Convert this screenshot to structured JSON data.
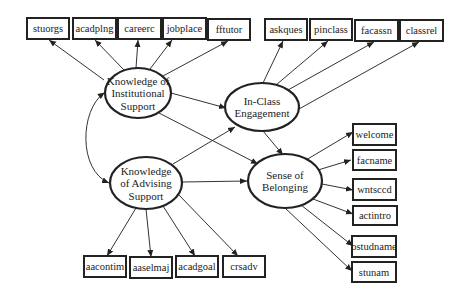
{
  "colors": {
    "stroke": "#222222",
    "background": "#ffffff"
  },
  "latents": [
    {
      "id": "kis",
      "lines": [
        "Knowledge of",
        "Institutional",
        "Support"
      ],
      "cx": 138,
      "cy": 93,
      "rx": 33,
      "ry": 25
    },
    {
      "id": "ice",
      "lines": [
        "In-Class",
        "Engagement"
      ],
      "cx": 262,
      "cy": 107,
      "rx": 37,
      "ry": 24
    },
    {
      "id": "kas",
      "lines": [
        "Knowledge",
        "of  Advising",
        "Support"
      ],
      "cx": 146,
      "cy": 183,
      "rx": 36,
      "ry": 26
    },
    {
      "id": "sob",
      "lines": [
        "Sense of",
        "Belonging"
      ],
      "cx": 285,
      "cy": 181,
      "rx": 37,
      "ry": 27
    }
  ],
  "indicators": [
    {
      "id": "stuorgs",
      "label": "stuorgs",
      "x": 27,
      "y": 18,
      "w": 42,
      "h": 21,
      "factor": "kis"
    },
    {
      "id": "acadplng",
      "label": "acadplng",
      "x": 73,
      "y": 18,
      "w": 43,
      "h": 21,
      "factor": "kis"
    },
    {
      "id": "careerc",
      "label": "careerc",
      "x": 118,
      "y": 18,
      "w": 43,
      "h": 21,
      "factor": "kis"
    },
    {
      "id": "jobplace",
      "label": "jobplace",
      "x": 163,
      "y": 18,
      "w": 43,
      "h": 21,
      "factor": "kis"
    },
    {
      "id": "fftutor",
      "label": "fftutor",
      "x": 208,
      "y": 19,
      "w": 42,
      "h": 21,
      "factor": "kis"
    },
    {
      "id": "askques",
      "label": "askques",
      "x": 265,
      "y": 19,
      "w": 42,
      "h": 21,
      "factor": "ice"
    },
    {
      "id": "pinclass",
      "label": "pinclass",
      "x": 310,
      "y": 19,
      "w": 42,
      "h": 21,
      "factor": "ice"
    },
    {
      "id": "facassn",
      "label": "facassn",
      "x": 355,
      "y": 20,
      "w": 43,
      "h": 21,
      "factor": "ice"
    },
    {
      "id": "classrel",
      "label": "classrel",
      "x": 400,
      "y": 20,
      "w": 43,
      "h": 21,
      "factor": "ice"
    },
    {
      "id": "welcome",
      "label": "welcome",
      "x": 353,
      "y": 124,
      "w": 43,
      "h": 21,
      "factor": "sob"
    },
    {
      "id": "facname",
      "label": "facname",
      "x": 353,
      "y": 150,
      "w": 43,
      "h": 20,
      "factor": "sob"
    },
    {
      "id": "wntsccd",
      "label": "wntsccd",
      "x": 353,
      "y": 179,
      "w": 43,
      "h": 21,
      "factor": "sob"
    },
    {
      "id": "actintro",
      "label": "actintro",
      "x": 353,
      "y": 206,
      "w": 44,
      "h": 19,
      "factor": "sob"
    },
    {
      "id": "ostudname",
      "label": "ostudname",
      "x": 352,
      "y": 236,
      "w": 44,
      "h": 21,
      "factor": "sob"
    },
    {
      "id": "stunam",
      "label": "stunam",
      "x": 352,
      "y": 262,
      "w": 44,
      "h": 20,
      "factor": "sob"
    },
    {
      "id": "aacontim",
      "label": "aacontim",
      "x": 84,
      "y": 256,
      "w": 42,
      "h": 21,
      "factor": "kas"
    },
    {
      "id": "aaselmaj",
      "label": "aaselmaj",
      "x": 130,
      "y": 257,
      "w": 42,
      "h": 21,
      "factor": "kas"
    },
    {
      "id": "acadgoal",
      "label": "acadgoal",
      "x": 176,
      "y": 256,
      "w": 42,
      "h": 21,
      "factor": "kas"
    },
    {
      "id": "crsadv",
      "label": "crsadv",
      "x": 223,
      "y": 256,
      "w": 42,
      "h": 21,
      "factor": "kas"
    }
  ],
  "loadings": [
    {
      "from": [
        104,
        80
      ],
      "to": [
        49,
        40
      ]
    },
    {
      "from": [
        124,
        70
      ],
      "to": [
        95,
        40
      ]
    },
    {
      "from": [
        136,
        68
      ],
      "to": [
        138,
        40
      ]
    },
    {
      "from": [
        150,
        69
      ],
      "to": [
        172,
        40
      ]
    },
    {
      "from": [
        163,
        76
      ],
      "to": [
        228,
        41
      ]
    },
    {
      "from": [
        263,
        83
      ],
      "to": [
        283,
        41
      ]
    },
    {
      "from": [
        276,
        85
      ],
      "to": [
        328,
        41
      ]
    },
    {
      "from": [
        288,
        90
      ],
      "to": [
        374,
        42
      ]
    },
    {
      "from": [
        299,
        109
      ],
      "to": [
        419,
        42
      ]
    },
    {
      "from": [
        306,
        160
      ],
      "to": [
        353,
        132
      ]
    },
    {
      "from": [
        318,
        170
      ],
      "to": [
        351,
        160
      ]
    },
    {
      "from": [
        322,
        184
      ],
      "to": [
        353,
        190
      ]
    },
    {
      "from": [
        313,
        199
      ],
      "to": [
        353,
        214
      ]
    },
    {
      "from": [
        301,
        205
      ],
      "to": [
        353,
        246
      ]
    },
    {
      "from": [
        285,
        208
      ],
      "to": [
        352,
        271
      ]
    },
    {
      "from": [
        136,
        208
      ],
      "to": [
        107,
        256
      ]
    },
    {
      "from": [
        146,
        209
      ],
      "to": [
        151,
        257
      ]
    },
    {
      "from": [
        163,
        206
      ],
      "to": [
        195,
        256
      ]
    },
    {
      "from": [
        178,
        194
      ],
      "to": [
        238,
        256
      ]
    }
  ],
  "structural": [
    {
      "from": [
        171,
        93
      ],
      "to": [
        226,
        108
      ]
    },
    {
      "from": [
        159,
        113
      ],
      "to": [
        258,
        164
      ]
    },
    {
      "from": [
        173,
        164
      ],
      "to": [
        235,
        127
      ]
    },
    {
      "from": [
        182,
        182
      ],
      "to": [
        247,
        181
      ]
    },
    {
      "from": [
        263,
        131
      ],
      "to": [
        283,
        155
      ]
    }
  ],
  "covariance": {
    "path": "M104,93 C80,110 78,170 109,183"
  }
}
